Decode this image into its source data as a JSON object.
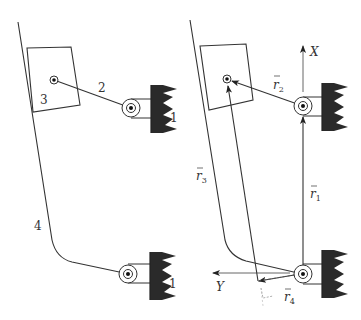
{
  "colors": {
    "line": "#333333",
    "ground_fill": "#2a2a2a",
    "background": "#ffffff"
  },
  "left_figure": {
    "labels": {
      "link_1_upper": "1",
      "link_1_lower": "1",
      "link_2": "2",
      "link_3": "3",
      "link_4": "4"
    }
  },
  "right_figure": {
    "axes": {
      "x_label": "X",
      "y_label": "Y"
    },
    "vectors": {
      "r1": {
        "symbol": "r",
        "sub": "1"
      },
      "r2": {
        "symbol": "r",
        "sub": "2"
      },
      "r3": {
        "symbol": "r",
        "sub": "3"
      },
      "r4": {
        "symbol": "r",
        "sub": "4"
      }
    }
  }
}
